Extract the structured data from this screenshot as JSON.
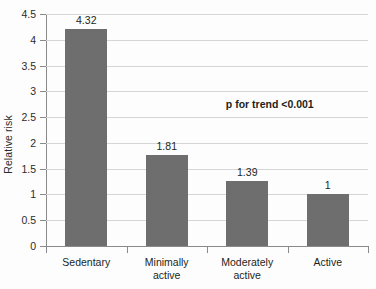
{
  "chart_data": {
    "type": "bar",
    "title": "",
    "xlabel": "",
    "ylabel": "Relative risk",
    "categories": [
      "Sedentary",
      "Minimally active",
      "Moderately active",
      "Active"
    ],
    "category_lines": [
      [
        "Sedentary"
      ],
      [
        "Minimally",
        "active"
      ],
      [
        "Moderately",
        "active"
      ],
      [
        "Active"
      ]
    ],
    "values": [
      4.32,
      1.81,
      1.39,
      1
    ],
    "value_labels": [
      "4.32",
      "1.81",
      "1.39",
      "1"
    ],
    "bar_plot_heights": [
      4.21,
      1.77,
      1.27,
      1.01
    ],
    "ylim": [
      0,
      4.5
    ],
    "ytick_values": [
      0,
      0.5,
      1,
      1.5,
      2,
      2.5,
      3,
      3.5,
      4,
      4.5
    ],
    "ytick_labels": [
      "0",
      "0.5",
      "1",
      "1.5",
      "2",
      "2.5",
      "3",
      "3.5",
      "4",
      "4.5"
    ],
    "grid": true,
    "legend": false,
    "legend_position": "none",
    "annotations": [
      {
        "text": "p for trend <0.001",
        "x_frac": 0.695,
        "y_value": 2.75
      }
    ],
    "colors": {
      "bar": "#6e6e6e",
      "gridline": "#d6d6d6",
      "axis": "#8a8a8a",
      "text": "#231f20",
      "background": "#fdfdfd"
    }
  }
}
